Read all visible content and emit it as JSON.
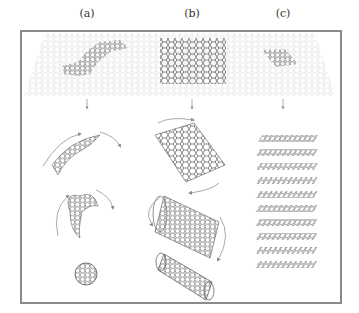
{
  "figure": {
    "panel_labels": [
      "(a)",
      "(b)",
      "(c)"
    ],
    "panels": [
      {
        "id": "a",
        "source": "graphene-patch-irregular",
        "steps": [
          "curved-fragment",
          "partial-sphere",
          "fullerene-ball"
        ]
      },
      {
        "id": "b",
        "source": "graphene-rectangle",
        "steps": [
          "rolling-sheet",
          "open-nanotube",
          "closed-nanotube"
        ]
      },
      {
        "id": "c",
        "source": "graphene-small-patch",
        "steps": [
          "stacked-graphite-layers"
        ]
      }
    ],
    "colors": {
      "frame": "#8a8a8a",
      "lattice_faint": "#cfcfcf",
      "lattice_dark": "#555555",
      "arrow": "#9a9a9a"
    }
  }
}
